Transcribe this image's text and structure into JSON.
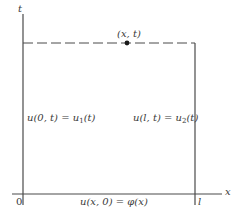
{
  "diagram": {
    "axes": {
      "t_label": "t",
      "x_label": "x",
      "origin_label": "0",
      "length_label": "l"
    },
    "point": {
      "label": "(x, t)"
    },
    "boundary_conditions": {
      "left": {
        "lhs": "u(0, t) = u",
        "sub": "1",
        "rhs": "(t)"
      },
      "right": {
        "lhs": "u(l, t) = u",
        "sub": "2",
        "rhs": "(t)"
      },
      "initial": "u(x, 0) = φ(x)"
    },
    "colors": {
      "line": "#4a4a4a",
      "text": "#3a3a3a",
      "background": "#ffffff"
    }
  }
}
